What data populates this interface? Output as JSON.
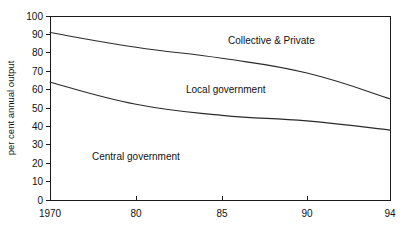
{
  "chart_data": {
    "type": "area",
    "title": "",
    "subtitle": "",
    "xlabel": "",
    "ylabel": "per cent annual output",
    "x": [
      1970,
      1980,
      1985,
      1990,
      1994
    ],
    "xtick_labels": [
      "1970",
      "80",
      "85",
      "90",
      "94"
    ],
    "ytick_labels": [
      "0",
      "10",
      "20",
      "30",
      "40",
      "50",
      "60",
      "70",
      "80",
      "90",
      "100"
    ],
    "ytick_values": [
      0,
      10,
      20,
      30,
      40,
      50,
      60,
      70,
      80,
      90,
      100
    ],
    "ylim": [
      0,
      100
    ],
    "xlim": [
      1970,
      1994
    ],
    "grid": false,
    "legend_position": "inline-annotations",
    "boundaries": [
      {
        "name": "central-government-upper-boundary",
        "values": [
          64,
          52,
          46,
          43,
          38
        ]
      },
      {
        "name": "local-government-upper-boundary",
        "values": [
          91,
          83,
          77,
          69,
          55
        ]
      }
    ],
    "series": [
      {
        "name": "Central government",
        "values": [
          64,
          52,
          46,
          43,
          38
        ]
      },
      {
        "name": "Local government",
        "values": [
          27,
          31,
          31,
          26,
          17
        ]
      },
      {
        "name": "Collective & Private",
        "values": [
          9,
          17,
          23,
          31,
          45
        ]
      }
    ],
    "annotations": [
      {
        "name": "collective-and-private",
        "text": "Collective & Private",
        "x_px": 228,
        "y_px": 44
      },
      {
        "name": "local-government",
        "text": "Local government",
        "x_px": 186,
        "y_px": 93
      },
      {
        "name": "central-government",
        "text": "Central government",
        "x_px": 92,
        "y_px": 160
      }
    ],
    "colors": {
      "line": "#2a2a2a",
      "axis": "#1a1a1a",
      "text": "#111111",
      "background": "#ffffff"
    }
  },
  "geometry": {
    "plot_left": 50,
    "plot_right": 390,
    "plot_top": 16,
    "plot_bottom": 200,
    "x_tick_px": [
      50,
      136,
      222,
      307,
      390
    ],
    "y_tick_px": [
      200,
      181.6,
      163.2,
      144.8,
      126.4,
      108,
      89.6,
      71.2,
      52.8,
      34.4,
      16
    ]
  }
}
